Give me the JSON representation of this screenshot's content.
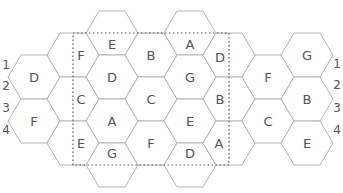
{
  "puzzle": {
    "hex": {
      "half_width": 26,
      "half_height": 22
    },
    "colors": {
      "grid_line": "#b4b4b4",
      "text": "#555555",
      "frame": "#555555",
      "background": "#ffffff"
    },
    "frame": {
      "x1": 73,
      "y1": 33,
      "x2": 229,
      "y2": 165
    },
    "cells": [
      {
        "cx": 34,
        "cy": 77,
        "label": "D",
        "lx": 34,
        "ly": 77
      },
      {
        "cx": 34,
        "cy": 121,
        "label": "F",
        "lx": 34,
        "ly": 121
      },
      {
        "cx": 73,
        "cy": 55,
        "label": "F",
        "lx": 81,
        "ly": 55
      },
      {
        "cx": 73,
        "cy": 99,
        "label": "C",
        "lx": 81,
        "ly": 99
      },
      {
        "cx": 73,
        "cy": 143,
        "label": "E",
        "lx": 81,
        "ly": 143
      },
      {
        "cx": 112,
        "cy": 33,
        "label": "E",
        "lx": 112,
        "ly": 44
      },
      {
        "cx": 112,
        "cy": 77,
        "label": "D",
        "lx": 112,
        "ly": 77
      },
      {
        "cx": 112,
        "cy": 121,
        "label": "A",
        "lx": 112,
        "ly": 121
      },
      {
        "cx": 112,
        "cy": 165,
        "label": "G",
        "lx": 112,
        "ly": 153
      },
      {
        "cx": 151,
        "cy": 55,
        "label": "B",
        "lx": 151,
        "ly": 55
      },
      {
        "cx": 151,
        "cy": 99,
        "label": "C",
        "lx": 151,
        "ly": 99
      },
      {
        "cx": 151,
        "cy": 143,
        "label": "F",
        "lx": 151,
        "ly": 143
      },
      {
        "cx": 190,
        "cy": 33,
        "label": "A",
        "lx": 190,
        "ly": 44
      },
      {
        "cx": 190,
        "cy": 77,
        "label": "G",
        "lx": 190,
        "ly": 77
      },
      {
        "cx": 190,
        "cy": 121,
        "label": "E",
        "lx": 190,
        "ly": 121
      },
      {
        "cx": 190,
        "cy": 165,
        "label": "D",
        "lx": 190,
        "ly": 153
      },
      {
        "cx": 229,
        "cy": 55,
        "label": "D",
        "lx": 220,
        "ly": 57
      },
      {
        "cx": 229,
        "cy": 99,
        "label": "B",
        "lx": 220,
        "ly": 99
      },
      {
        "cx": 229,
        "cy": 143,
        "label": "A",
        "lx": 219,
        "ly": 143
      },
      {
        "cx": 268,
        "cy": 77,
        "label": "F",
        "lx": 268,
        "ly": 77
      },
      {
        "cx": 268,
        "cy": 121,
        "label": "C",
        "lx": 268,
        "ly": 121
      },
      {
        "cx": 307,
        "cy": 55,
        "label": "G",
        "lx": 307,
        "ly": 55
      },
      {
        "cx": 307,
        "cy": 99,
        "label": "B",
        "lx": 307,
        "ly": 99
      },
      {
        "cx": 307,
        "cy": 143,
        "label": "E",
        "lx": 307,
        "ly": 143
      }
    ],
    "row_numbers_left": [
      {
        "label": "1",
        "x": 6,
        "y": 65
      },
      {
        "label": "2",
        "x": 6,
        "y": 86
      },
      {
        "label": "3",
        "x": 6,
        "y": 108
      },
      {
        "label": "4",
        "x": 6,
        "y": 130
      }
    ],
    "row_numbers_right": [
      {
        "label": "1",
        "x": 337,
        "y": 64
      },
      {
        "label": "2",
        "x": 337,
        "y": 85
      },
      {
        "label": "3",
        "x": 337,
        "y": 108
      },
      {
        "label": "4",
        "x": 337,
        "y": 130
      }
    ]
  }
}
